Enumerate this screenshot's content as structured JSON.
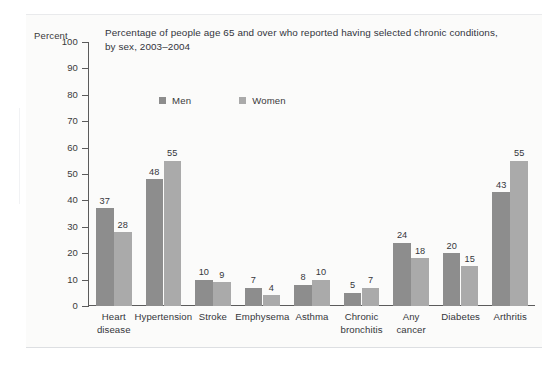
{
  "chart_data": {
    "type": "bar",
    "title": "Percentage of people age 65 and over who reported having selected chronic conditions,",
    "subtitle": "by sex, 2003–2004",
    "xlabel": "",
    "ylabel": "Percent",
    "ylim": [
      0,
      100
    ],
    "ytick_step": 10,
    "yticks": [
      "100",
      "90",
      "80",
      "70",
      "60",
      "50",
      "40",
      "30",
      "20",
      "10",
      "0"
    ],
    "grid": false,
    "legend_position": "top-left",
    "categories": [
      [
        "Heart",
        "disease"
      ],
      [
        "Hypertension"
      ],
      [
        "Stroke"
      ],
      [
        "Emphysema"
      ],
      [
        "Asthma"
      ],
      [
        "Chronic",
        "bronchitis"
      ],
      [
        "Any",
        "cancer"
      ],
      [
        "Diabetes"
      ],
      [
        "Arthritis"
      ]
    ],
    "category_labels": [
      "Heart disease",
      "Hypertension",
      "Stroke",
      "Emphysema",
      "Asthma",
      "Chronic bronchitis",
      "Any cancer",
      "Diabetes",
      "Arthritis"
    ],
    "series": [
      {
        "name": "Men",
        "color": "#8d8d8d",
        "values": [
          37,
          48,
          10,
          7,
          8,
          5,
          24,
          20,
          43
        ]
      },
      {
        "name": "Women",
        "color": "#aaaaaa",
        "values": [
          28,
          55,
          9,
          4,
          10,
          7,
          18,
          15,
          55
        ]
      }
    ]
  },
  "legend": [
    {
      "label": "Men",
      "color": "#8d8d8d"
    },
    {
      "label": "Women",
      "color": "#aaaaaa"
    }
  ],
  "axis": {
    "unit_label": "Percent"
  }
}
